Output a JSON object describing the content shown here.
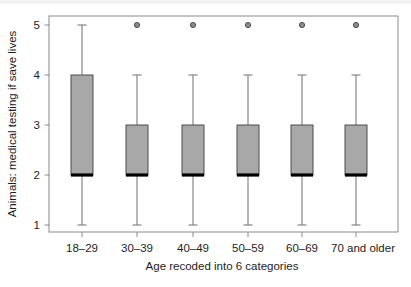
{
  "chart_data": {
    "type": "box",
    "title": "",
    "xlabel": "Age recoded into 6 categories",
    "ylabel": "Animals: medical testing if save lives",
    "ylim": [
      0.85,
      5.3
    ],
    "yticks": [
      1,
      2,
      3,
      4,
      5
    ],
    "ytick_labels": [
      "1",
      "2",
      "3",
      "4",
      "5"
    ],
    "grid": false,
    "legend": "none",
    "categories": [
      "18–29",
      "30–39",
      "40–49",
      "50–59",
      "60–69",
      "70 and older"
    ],
    "boxes": [
      {
        "category": "18–29",
        "whisker_low": 1,
        "q1": 2,
        "median": 2,
        "q3": 4,
        "whisker_high": 5,
        "outliers": []
      },
      {
        "category": "30–39",
        "whisker_low": 1,
        "q1": 2,
        "median": 2,
        "q3": 3,
        "whisker_high": 4,
        "outliers": [
          5
        ]
      },
      {
        "category": "40–49",
        "whisker_low": 1,
        "q1": 2,
        "median": 2,
        "q3": 3,
        "whisker_high": 4,
        "outliers": [
          5
        ]
      },
      {
        "category": "50–59",
        "whisker_low": 1,
        "q1": 2,
        "median": 2,
        "q3": 3,
        "whisker_high": 4,
        "outliers": [
          5
        ]
      },
      {
        "category": "60–69",
        "whisker_low": 1,
        "q1": 2,
        "median": 2,
        "q3": 3,
        "whisker_high": 4,
        "outliers": [
          5
        ]
      },
      {
        "category": "70 and older",
        "whisker_low": 1,
        "q1": 2,
        "median": 2,
        "q3": 3,
        "whisker_high": 4,
        "outliers": [
          5
        ]
      }
    ],
    "colors": {
      "box_fill": "#a8a8a8",
      "box_edge": "#4d4d4d",
      "median": "#000000",
      "whisker": "#6e6e6e",
      "outlier_fill": "#8c8c8c",
      "outlier_edge": "#4d4d4d",
      "frame": "#8a8a8a",
      "text": "#1d1d1d"
    }
  },
  "axes": {
    "ytick_1": "1",
    "ytick_2": "2",
    "ytick_3": "3",
    "ytick_4": "4",
    "ytick_5": "5",
    "ylabel": "Animals: medical testing if save lives",
    "xlabel": "Age recoded into 6 categories",
    "xtick_1": "18–29",
    "xtick_2": "30–39",
    "xtick_3": "40–49",
    "xtick_4": "50–59",
    "xtick_5": "60–69",
    "xtick_6": "70 and older"
  }
}
